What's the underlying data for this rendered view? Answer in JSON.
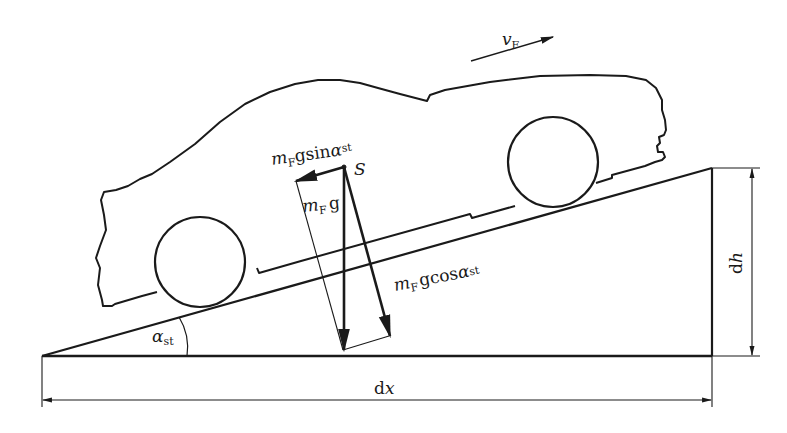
{
  "diagram": {
    "colors": {
      "line": "#1a1a1a",
      "background": "#ffffff"
    },
    "labels": {
      "velocity": {
        "main": "v",
        "sub": "F"
      },
      "center_of_gravity": "S",
      "downhill_force": {
        "main": "m",
        "sub1": "F",
        "mid": "gsin",
        "greek": "α",
        "sub2": "st"
      },
      "weight": {
        "main": "m",
        "sub1": "F",
        "tail": "g"
      },
      "normal_force": {
        "main": "m",
        "sub1": "F",
        "mid": "gcos",
        "greek": "α",
        "sub2": "st"
      },
      "slope_angle": {
        "greek": "α",
        "sub": "st"
      },
      "horizontal_dimension": {
        "d": "d",
        "var": "x"
      },
      "vertical_dimension": {
        "d": "d",
        "var": "h"
      }
    },
    "geometry": {
      "ramp": {
        "base_left": [
          42,
          356
        ],
        "base_right": [
          712,
          356
        ],
        "top_right": [
          712,
          168
        ]
      },
      "rear_wheel": {
        "cx": 200,
        "cy": 262,
        "r": 45
      },
      "front_wheel": {
        "cx": 553,
        "cy": 162,
        "r": 45
      },
      "center_S": [
        344,
        167
      ]
    }
  }
}
